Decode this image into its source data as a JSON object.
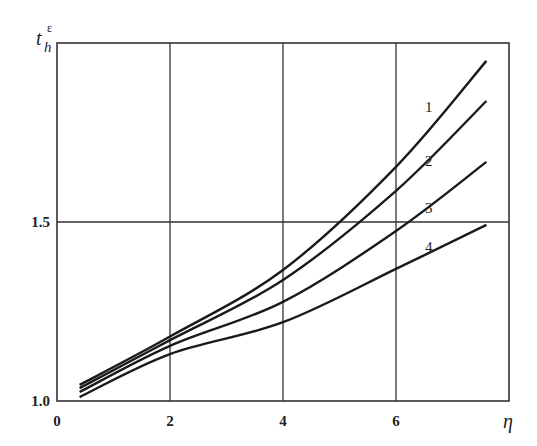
{
  "chart_data": {
    "type": "line",
    "title": "",
    "xlabel": "η",
    "ylabel": "t_h^ε",
    "xlim": [
      0,
      8
    ],
    "ylim": [
      1.0,
      2.0
    ],
    "x_ticks": [
      "0",
      "2",
      "4",
      "6"
    ],
    "y_ticks": [
      "1.0",
      "1.5"
    ],
    "grid": {
      "x": [
        2,
        4,
        6
      ],
      "y": [
        1.5
      ]
    },
    "x": [
      0.4,
      2,
      4,
      6,
      7.6
    ],
    "series": [
      {
        "name": "1",
        "values": [
          1.045,
          1.18,
          1.366,
          1.654,
          1.95
        ]
      },
      {
        "name": "2",
        "values": [
          1.036,
          1.17,
          1.338,
          1.587,
          1.838
        ]
      },
      {
        "name": "3",
        "values": [
          1.025,
          1.154,
          1.277,
          1.475,
          1.668
        ]
      },
      {
        "name": "4",
        "values": [
          1.011,
          1.131,
          1.22,
          1.369,
          1.492
        ]
      }
    ],
    "curve_labels": [
      {
        "text": "1",
        "x": 6.3,
        "y": 1.82
      },
      {
        "text": "2",
        "x": 6.3,
        "y": 1.67
      },
      {
        "text": "3",
        "x": 6.3,
        "y": 1.54
      },
      {
        "text": "4",
        "x": 6.3,
        "y": 1.43
      }
    ]
  },
  "axes": {
    "xlabel": "η",
    "ylabel_main": "t",
    "ylabel_sub": "h",
    "ylabel_sup": "ε",
    "x_tick_labels": [
      "0",
      "2",
      "4",
      "6"
    ],
    "y_tick_labels": [
      "1.0",
      "1.5"
    ]
  },
  "labels": [
    "1",
    "2",
    "3",
    "4"
  ]
}
